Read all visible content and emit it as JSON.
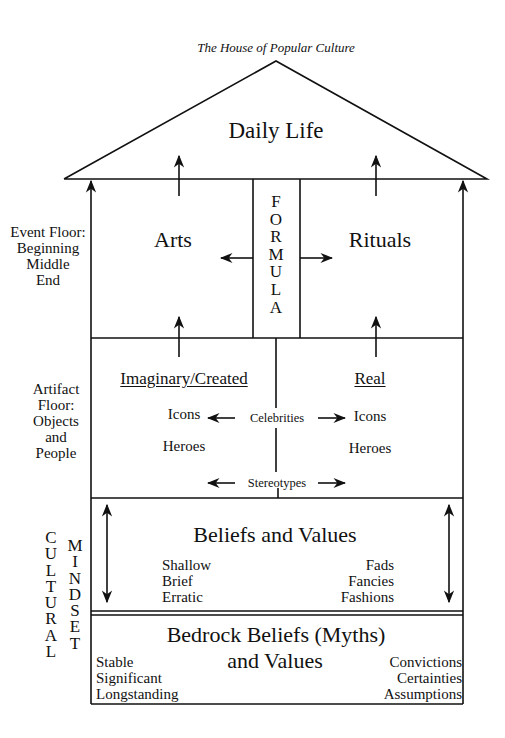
{
  "title": "The House of Popular Culture",
  "roof": {
    "label": "Daily Life"
  },
  "event_floor": {
    "side_label": [
      "Event Floor:",
      "Beginning",
      "Middle",
      "End"
    ],
    "left": "Arts",
    "right": "Rituals",
    "center_column": [
      "F",
      "O",
      "R",
      "M",
      "U",
      "L",
      "A"
    ]
  },
  "artifact_floor": {
    "side_label": [
      "Artifact",
      "Floor:",
      "Objects",
      "and",
      "People"
    ],
    "left_heading": "Imaginary/Created",
    "right_heading": "Real",
    "left_items": [
      "Icons",
      "Heroes"
    ],
    "right_items": [
      "Icons",
      "Heroes"
    ],
    "center_top": "Celebrities",
    "center_bottom": "Stereotypes"
  },
  "cultural_mindset": {
    "col1": [
      "C",
      "U",
      "L",
      "T",
      "U",
      "R",
      "A",
      "L"
    ],
    "col2": [
      "M",
      "I",
      "N",
      "D",
      "S",
      "E",
      "T"
    ]
  },
  "beliefs_floor": {
    "heading": "Beliefs and Values",
    "left_items": [
      "Shallow",
      "Brief",
      "Erratic"
    ],
    "right_items": [
      "Fads",
      "Fancies",
      "Fashions"
    ]
  },
  "bedrock_floor": {
    "heading_line1": "Bedrock Beliefs (Myths)",
    "heading_line2": "and Values",
    "left_items": [
      "Stable",
      "Significant",
      "Longstanding"
    ],
    "right_items": [
      "Convictions",
      "Certainties",
      "Assumptions"
    ]
  }
}
